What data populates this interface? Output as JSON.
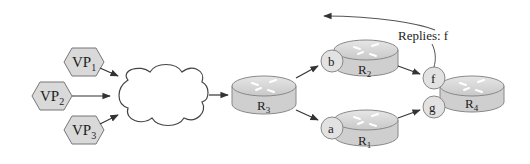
{
  "vantage_points": [
    {
      "id": "vp1",
      "base": "VP",
      "sub": "1"
    },
    {
      "id": "vp2",
      "base": "VP",
      "sub": "2"
    },
    {
      "id": "vp3",
      "base": "VP",
      "sub": "3"
    }
  ],
  "routers": [
    {
      "id": "r3",
      "base": "R",
      "sub": "3"
    },
    {
      "id": "r2",
      "base": "R",
      "sub": "2"
    },
    {
      "id": "r1",
      "base": "R",
      "sub": "1"
    },
    {
      "id": "r4",
      "base": "R",
      "sub": "4"
    }
  ],
  "interfaces": {
    "b": "b",
    "a": "a",
    "f": "f",
    "g": "g"
  },
  "annotation": {
    "replies": "Replies: f"
  },
  "colors": {
    "router_fill": "#cfcfcf",
    "router_top": "#dcdcdc",
    "vp_fill": "#d9d9d9",
    "stroke": "#555555",
    "arrow": "#333333"
  }
}
